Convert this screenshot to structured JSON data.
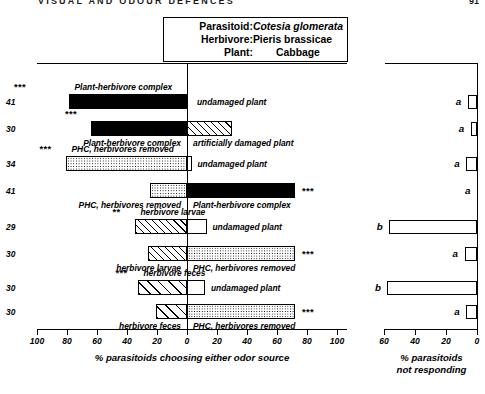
{
  "runhead": "VISUAL AND ODOUR DEFENCES",
  "pagenum": "91",
  "title_box": {
    "rows": [
      {
        "key": "Parasitoid:",
        "value": "Cotesia glomerata",
        "italic": true,
        "center": false
      },
      {
        "key": "Herbivore:",
        "value": "Pieris brassicae",
        "italic": false,
        "center": false
      },
      {
        "key": "Plant:",
        "value": "Cabbage",
        "italic": false,
        "center": true
      }
    ]
  },
  "chart_data": {
    "type": "bar",
    "orientation": "horizontal",
    "layout": "paired two-sided choice (Y-tube olfactometer), two panels",
    "panels": [
      {
        "name": "choice",
        "xlabel": "% parasitoids choosing either odor source",
        "ticks": [
          100,
          80,
          60,
          40,
          20,
          0,
          20,
          40,
          60,
          80,
          100
        ],
        "xlim_left": 100,
        "xlim_right": 100,
        "grid": false
      },
      {
        "name": "not_responding",
        "xlabel": "% parasitoids\nnot responding",
        "xlabel_line1": "% parasitoids",
        "xlabel_line2": "not responding",
        "ticks": [
          60,
          40,
          20,
          0
        ],
        "xlim": 60,
        "grid": false
      }
    ],
    "rows": [
      {
        "n": "41",
        "left_label": "Plant-herbivore complex",
        "left_value": 79,
        "left_fill": "black",
        "right_label": "undamaged plant",
        "right_value": 0,
        "right_fill": "white",
        "stars": "***",
        "stars_side": "left",
        "nonresp": 6,
        "group": "a"
      },
      {
        "n": "30",
        "left_label": "Plant-herbivore complex",
        "left_value": 64,
        "left_fill": "black",
        "right_label": "artificially damaged plant",
        "right_value": 30,
        "right_fill": "diag",
        "stars": "***",
        "stars_side": "left",
        "nonresp": 4,
        "group": "a"
      },
      {
        "n": "34",
        "left_label": "PHC, herbivores removed",
        "left_value": 81,
        "left_fill": "dot",
        "right_label": "undamaged plant",
        "right_value": 3,
        "right_fill": "white",
        "stars": "***",
        "stars_side": "left",
        "nonresp": 7,
        "group": "a"
      },
      {
        "n": "41",
        "left_label": "PHC, herbivores removed",
        "left_value": 25,
        "left_fill": "dot",
        "right_label": "Plant-herbivore complex",
        "right_value": 72,
        "right_fill": "black",
        "stars": "***",
        "stars_side": "right",
        "nonresp": 0,
        "group": "a"
      },
      {
        "n": "29",
        "left_label": "herbivore larvae",
        "left_value": 35,
        "left_fill": "diag",
        "right_label": "undamaged plant",
        "right_value": 13,
        "right_fill": "white",
        "stars": "**",
        "stars_side": "left",
        "nonresp": 57,
        "group": "b"
      },
      {
        "n": "30",
        "left_label": "herbivore larvae",
        "left_value": 26,
        "left_fill": "diag",
        "right_label": "PHC, herbivores removed",
        "right_value": 72,
        "right_fill": "dotdark",
        "stars": "***",
        "stars_side": "right",
        "nonresp": 8,
        "group": "a"
      },
      {
        "n": "30",
        "left_label": "herbivore feces",
        "left_value": 33,
        "left_fill": "diagwide",
        "right_label": "undamaged plant",
        "right_value": 12,
        "right_fill": "white",
        "stars": "***",
        "stars_side": "left",
        "nonresp": 58,
        "group": "b"
      },
      {
        "n": "30",
        "left_label": "herbivore feces",
        "left_value": 21,
        "left_fill": "diagwide",
        "right_label": "PHC, herbivores removed",
        "right_value": 72,
        "right_fill": "dotdark",
        "stars": "***",
        "stars_side": "right",
        "nonresp": 7,
        "group": "a"
      }
    ]
  }
}
